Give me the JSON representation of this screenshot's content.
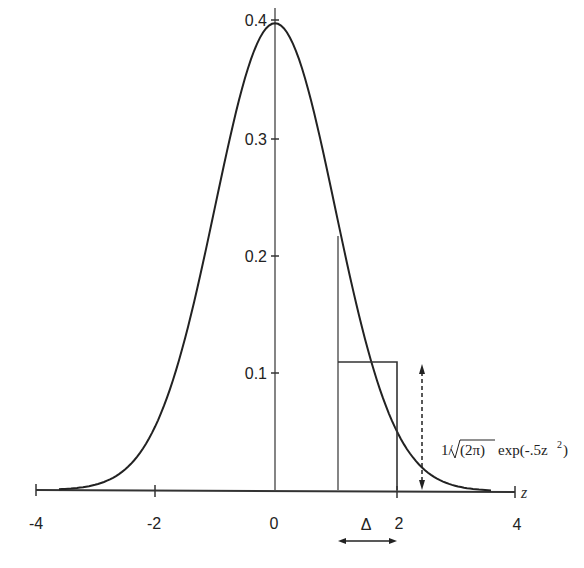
{
  "chart_data": {
    "type": "line",
    "title": "",
    "xlabel": "z",
    "ylabel": "",
    "xlim": [
      -4,
      4
    ],
    "ylim": [
      0,
      0.4
    ],
    "grid": false,
    "x_ticks": [
      "-4",
      "-2",
      "0",
      "2",
      "4"
    ],
    "y_ticks": [
      "0.1",
      "0.2",
      "0.3",
      "0.4"
    ],
    "series": [
      {
        "name": "standard normal density",
        "formula": "1/√(2π) exp(-.5z²)",
        "x": [
          -3.5,
          -3,
          -2.5,
          -2,
          -1.5,
          -1,
          -0.5,
          0,
          0.5,
          1,
          1.5,
          2,
          2.5,
          3,
          3.5
        ],
        "values": [
          0.0009,
          0.0044,
          0.0175,
          0.054,
          0.1295,
          0.242,
          0.3521,
          0.3989,
          0.3521,
          0.242,
          0.1295,
          0.054,
          0.0175,
          0.0044,
          0.0009
        ]
      }
    ],
    "annotations": {
      "vertical_line_at": 1,
      "rectangle": {
        "x_from": 1,
        "x_to": 2,
        "height": 0.11
      },
      "delta_label": "Δ",
      "delta_span": [
        1,
        2
      ],
      "density_arrow_at_x": 2.5,
      "formula_label": "1/√(2π) exp(-.5z²)"
    }
  },
  "labels": {
    "x_ticks": [
      "-4",
      "-2",
      "0",
      "2",
      "4"
    ],
    "y_ticks": [
      "0.1",
      "0.2",
      "0.3",
      "0.4"
    ],
    "z": "z",
    "delta": "Δ",
    "formula_prefix": "1/",
    "formula_radicand": "(2π)",
    "formula_suffix": "exp(-.5z",
    "formula_sup": "2",
    "formula_close": ")"
  }
}
